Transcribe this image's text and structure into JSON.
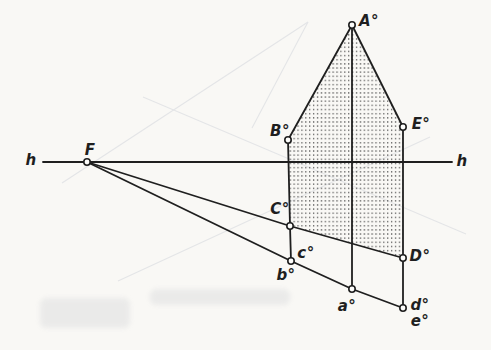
{
  "palette": {
    "paper": "#f9f8f5",
    "ink": "#1f1f1f",
    "point_fill": "#fdfdfb",
    "stipple": "#474747",
    "ghost": "#e4e5e7",
    "smudge": "#d9dadc"
  },
  "diagram": {
    "stroke_width": 1.8,
    "point_radius": 3.2,
    "horizon": {
      "label_left": "h",
      "label_right": "h"
    },
    "region": {
      "name": "stippled-pentagon",
      "points": [
        [
          352,
          25
        ],
        [
          403,
          127
        ],
        [
          403,
          258
        ],
        [
          290,
          226
        ],
        [
          288,
          140
        ]
      ]
    },
    "polylines": [
      {
        "name": "horizon-line",
        "points": [
          [
            43,
            162
          ],
          [
            452,
            162
          ]
        ]
      },
      {
        "name": "roof-edge-left",
        "points": [
          [
            352,
            25
          ],
          [
            288,
            140
          ]
        ]
      },
      {
        "name": "roof-edge-right",
        "points": [
          [
            352,
            25
          ],
          [
            403,
            127
          ]
        ]
      },
      {
        "name": "vertical-left-B-C-b",
        "points": [
          [
            288,
            140
          ],
          [
            290,
            226
          ],
          [
            291,
            261
          ]
        ]
      },
      {
        "name": "vertical-center-A-a",
        "points": [
          [
            352,
            25
          ],
          [
            352,
            289
          ]
        ]
      },
      {
        "name": "vertical-right-E-D-d",
        "points": [
          [
            403,
            127
          ],
          [
            403,
            258
          ],
          [
            403,
            308
          ]
        ]
      },
      {
        "name": "ray-F-C-D",
        "points": [
          [
            87,
            162
          ],
          [
            290,
            226
          ],
          [
            403,
            258
          ]
        ]
      },
      {
        "name": "ray-F-b-a-d",
        "points": [
          [
            87,
            162
          ],
          [
            291,
            261
          ],
          [
            352,
            289
          ],
          [
            403,
            308
          ]
        ]
      }
    ],
    "circles": [
      {
        "id": "F",
        "x": 87,
        "y": 162
      },
      {
        "id": "A",
        "x": 352,
        "y": 25
      },
      {
        "id": "B",
        "x": 288,
        "y": 140
      },
      {
        "id": "E",
        "x": 403,
        "y": 127
      },
      {
        "id": "C",
        "x": 290,
        "y": 226
      },
      {
        "id": "D",
        "x": 403,
        "y": 258
      },
      {
        "id": "bc",
        "x": 291,
        "y": 261
      },
      {
        "id": "a",
        "x": 352,
        "y": 289
      },
      {
        "id": "de",
        "x": 403,
        "y": 308
      }
    ],
    "labels": [
      {
        "name": "horizon-label-left",
        "text": "h",
        "x": 31,
        "y": 160
      },
      {
        "name": "horizon-label-right",
        "text": "h",
        "x": 462,
        "y": 161
      },
      {
        "name": "label-F",
        "text": "F",
        "x": 90,
        "y": 150
      },
      {
        "name": "label-A",
        "text": "A°",
        "x": 369,
        "y": 21
      },
      {
        "name": "label-B",
        "text": "B°",
        "x": 280,
        "y": 131
      },
      {
        "name": "label-E",
        "text": "E°",
        "x": 421,
        "y": 124
      },
      {
        "name": "label-C",
        "text": "C°",
        "x": 280,
        "y": 209
      },
      {
        "name": "label-D",
        "text": "D°",
        "x": 420,
        "y": 256
      },
      {
        "name": "label-c",
        "text": "c°",
        "x": 306,
        "y": 253
      },
      {
        "name": "label-b",
        "text": "b°",
        "x": 286,
        "y": 275
      },
      {
        "name": "label-a",
        "text": "a°",
        "x": 347,
        "y": 306
      },
      {
        "name": "label-d",
        "text": "d°",
        "x": 420,
        "y": 305
      },
      {
        "name": "label-e",
        "text": "e°",
        "x": 420,
        "y": 321
      }
    ],
    "ghost_lines": [
      {
        "points": [
          [
            62,
            183
          ],
          [
            308,
            22
          ]
        ]
      },
      {
        "points": [
          [
            308,
            22
          ],
          [
            252,
            128
          ]
        ]
      },
      {
        "points": [
          [
            118,
            281
          ],
          [
            430,
            137
          ]
        ]
      },
      {
        "points": [
          [
            143,
            97
          ],
          [
            466,
            234
          ]
        ]
      }
    ],
    "smudges": [
      {
        "x": 150,
        "y": 289,
        "w": 140,
        "h": 16
      },
      {
        "x": 40,
        "y": 298,
        "w": 90,
        "h": 30
      }
    ]
  }
}
